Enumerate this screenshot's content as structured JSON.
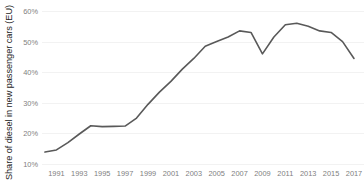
{
  "chart_data": {
    "type": "line",
    "title": "",
    "xlabel": "",
    "ylabel": "Share of diesel in new passenger cars (EU)",
    "ylim": [
      10,
      60
    ],
    "xlim": [
      1990,
      2017
    ],
    "grid": true,
    "legend": false,
    "y_ticks": [
      "10%",
      "20%",
      "30%",
      "40%",
      "50%",
      "60%"
    ],
    "y_tick_values": [
      10,
      20,
      30,
      40,
      50,
      60
    ],
    "x_ticks": [
      "1991",
      "1993",
      "1995",
      "1997",
      "1999",
      "2001",
      "2003",
      "2005",
      "2007",
      "2009",
      "2011",
      "2013",
      "2015",
      "2017"
    ],
    "x_tick_values": [
      1991,
      1993,
      1995,
      1997,
      1999,
      2001,
      2003,
      2005,
      2007,
      2009,
      2011,
      2013,
      2015,
      2017
    ],
    "series": [
      {
        "name": "Share of diesel in new passenger cars (EU)",
        "color": "#595959",
        "x": [
          1990,
          1991,
          1992,
          1993,
          1994,
          1995,
          1996,
          1997,
          1998,
          1999,
          2000,
          2001,
          2002,
          2003,
          2004,
          2005,
          2006,
          2007,
          2008,
          2009,
          2010,
          2011,
          2012,
          2013,
          2014,
          2015,
          2016,
          2017
        ],
        "values": [
          13.9,
          14.6,
          17.0,
          19.8,
          22.5,
          22.2,
          22.3,
          22.4,
          25.0,
          29.5,
          33.5,
          37.0,
          41.0,
          44.5,
          48.5,
          50.0,
          51.5,
          53.5,
          53.0,
          46.0,
          51.5,
          55.5,
          56.0,
          55.0,
          53.5,
          53.0,
          50.0,
          44.5
        ]
      }
    ],
    "style": {
      "line_color": "#595959",
      "grid_color": "#f2f2f2",
      "tick_label_color": "#808080",
      "axis_label_color": "#262626",
      "background": "#ffffff"
    }
  }
}
